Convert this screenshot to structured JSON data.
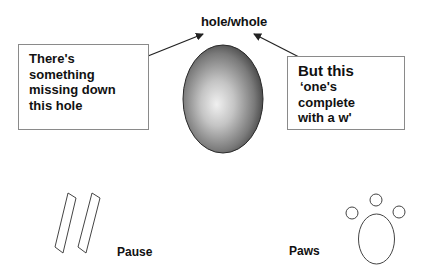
{
  "title": "hole/whole",
  "left_callout": {
    "lines": [
      "There's",
      "something",
      "missing down",
      "this hole"
    ]
  },
  "right_callout": {
    "lines": [
      "But this",
      "‘one's",
      "complete",
      "with a w'"
    ]
  },
  "center_shape": {
    "type": "egg-hole",
    "gradient_light": "#f2f2f2",
    "gradient_dark": "#3a3a3a"
  },
  "pause": {
    "label": "Pause",
    "icon": "pause-icon"
  },
  "paws": {
    "label": "Paws",
    "icon": "paw-print-icon"
  },
  "colors": {
    "text": "#111111",
    "box_border": "#8a8a8a",
    "arrow": "#222222",
    "outline": "#444444"
  }
}
